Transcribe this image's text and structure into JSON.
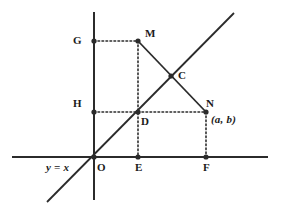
{
  "figure": {
    "width": 282,
    "height": 215,
    "background": "#ffffff",
    "stroke_color": "#2b2b2b",
    "label_color": "#1a1a1a"
  },
  "axes": {
    "x_axis": {
      "name": "x-axis",
      "x1": 12,
      "y1": 157,
      "x2": 268,
      "y2": 157,
      "stroke_width": 2
    },
    "y_axis": {
      "name": "y-axis",
      "x1": 94,
      "y1": 12,
      "x2": 94,
      "y2": 200,
      "stroke_width": 2
    },
    "origin": {
      "x": 94,
      "y": 157
    }
  },
  "lines": [
    {
      "name": "line-y-equals-x",
      "style": "solid",
      "x1": 47,
      "y1": 202,
      "x2": 234,
      "y2": 13,
      "stroke_width": 1.8
    },
    {
      "name": "segment-M-to-N",
      "style": "solid",
      "x1": 138,
      "y1": 41,
      "x2": 206,
      "y2": 112,
      "stroke_width": 1.8
    }
  ],
  "dotted_lines": [
    {
      "name": "dotted-G-to-M",
      "x1": 94,
      "y1": 41,
      "x2": 138,
      "y2": 41
    },
    {
      "name": "dotted-H-to-N",
      "x1": 94,
      "y1": 112,
      "x2": 206,
      "y2": 112
    },
    {
      "name": "dotted-M-to-E",
      "x1": 138,
      "y1": 41,
      "x2": 138,
      "y2": 157
    },
    {
      "name": "dotted-N-to-F",
      "x1": 206,
      "y1": 112,
      "x2": 206,
      "y2": 157
    }
  ],
  "points": [
    {
      "id": "G",
      "label": "G",
      "x": 94,
      "y": 41,
      "label_x": 73,
      "label_y": 35
    },
    {
      "id": "M",
      "label": "M",
      "x": 138,
      "y": 41,
      "label_x": 145,
      "label_y": 28
    },
    {
      "id": "C",
      "label": "C",
      "x": 171,
      "y": 76,
      "label_x": 178,
      "label_y": 70
    },
    {
      "id": "H",
      "label": "H",
      "x": 94,
      "y": 112,
      "label_x": 73,
      "label_y": 98
    },
    {
      "id": "D",
      "label": "D",
      "x": 138,
      "y": 112,
      "label_x": 141,
      "label_y": 116
    },
    {
      "id": "N",
      "label": "N",
      "x": 206,
      "y": 112,
      "label_x": 206,
      "label_y": 98
    },
    {
      "id": "O",
      "label": "O",
      "x": 94,
      "y": 157,
      "label_x": 97,
      "label_y": 162
    },
    {
      "id": "E",
      "label": "E",
      "x": 138,
      "y": 157,
      "label_x": 135,
      "label_y": 162
    },
    {
      "id": "F",
      "label": "F",
      "x": 206,
      "y": 157,
      "label_x": 203,
      "label_y": 162
    }
  ],
  "annotations": {
    "line_equation": {
      "text": "y = x",
      "x": 46,
      "y": 162
    },
    "coordinate_pair": {
      "text": "(a, b)",
      "x": 211,
      "y": 114
    }
  }
}
